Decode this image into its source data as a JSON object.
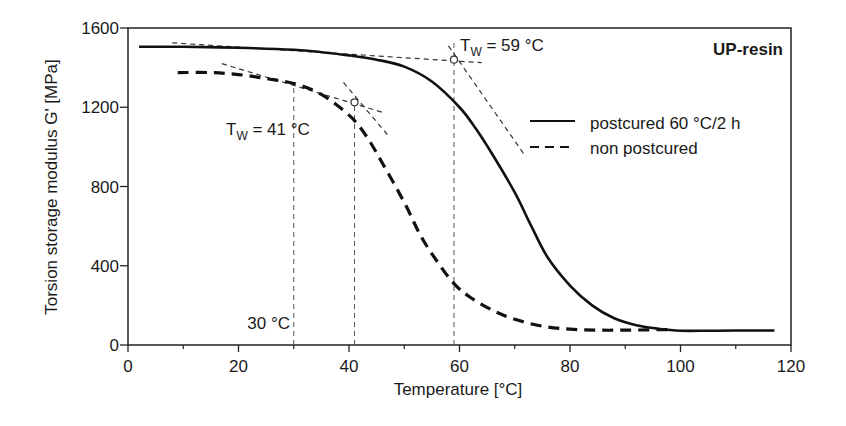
{
  "chart_data": {
    "type": "line",
    "title": "UP-resin",
    "xlabel": "Temperature [°C]",
    "ylabel": "Torsion storage modulus G' [MPa]",
    "xlim": [
      0,
      120
    ],
    "ylim": [
      0,
      1600
    ],
    "xticks": [
      0,
      20,
      40,
      60,
      80,
      100,
      120
    ],
    "yticks": [
      0,
      400,
      800,
      1200,
      1600
    ],
    "grid": false,
    "legend_position": "right-middle",
    "series": [
      {
        "name": "postcured 60 °C/2 h",
        "style": "solid",
        "x": [
          2,
          10,
          20,
          30,
          35,
          40,
          45,
          50,
          55,
          60,
          63,
          66,
          70,
          73,
          76,
          80,
          84,
          88,
          92,
          96,
          100,
          105,
          110,
          117
        ],
        "y": [
          1505,
          1505,
          1500,
          1490,
          1478,
          1462,
          1440,
          1405,
          1330,
          1200,
          1090,
          960,
          770,
          600,
          440,
          300,
          200,
          135,
          100,
          82,
          72,
          72,
          73,
          73
        ]
      },
      {
        "name": "non postcured",
        "style": "dashed",
        "x": [
          9,
          15,
          20,
          25,
          30,
          35,
          40,
          43,
          46,
          50,
          53,
          56,
          59,
          62,
          66,
          70,
          75,
          80,
          85,
          90,
          95,
          98
        ],
        "y": [
          1375,
          1375,
          1365,
          1345,
          1320,
          1265,
          1160,
          1060,
          920,
          720,
          550,
          420,
          310,
          240,
          175,
          130,
          95,
          80,
          75,
          75,
          77,
          78
        ]
      }
    ],
    "annotations": [
      {
        "text": "T",
        "sub": "W",
        "rest": " = 59 °C",
        "x": 59,
        "y": 1440,
        "label_pos": [
          61,
          1525
        ]
      },
      {
        "text": "T",
        "sub": "W",
        "rest": " = 41 °C",
        "x": 41,
        "y": 1225,
        "label_pos": [
          18,
          1080
        ]
      },
      {
        "text": "30 °C",
        "x": 30,
        "label_pos": [
          19,
          40
        ]
      }
    ],
    "reference_lines": {
      "vertical": [
        30,
        41,
        59
      ],
      "tangents": [
        {
          "from": [
            8,
            1525
          ],
          "to": [
            64,
            1425
          ]
        },
        {
          "from": [
            58,
            1510
          ],
          "to": [
            72,
            950
          ]
        },
        {
          "from": [
            17,
            1420
          ],
          "to": [
            46,
            1175
          ]
        },
        {
          "from": [
            39,
            1325
          ],
          "to": [
            47,
            1060
          ]
        }
      ]
    }
  },
  "labels": {
    "title": "UP-resin",
    "xlabel": "Temperature [°C]",
    "ylabel": "Torsion storage modulus G' [MPa]",
    "legend_solid": "postcured 60 °C/2 h",
    "legend_dashed": "non postcured",
    "tw59_T": "T",
    "tw59_sub": "W",
    "tw59_rest": " = 59 °C",
    "tw41_T": "T",
    "tw41_sub": "W",
    "tw41_rest": " = 41 °C",
    "t30": "30 °C"
  }
}
